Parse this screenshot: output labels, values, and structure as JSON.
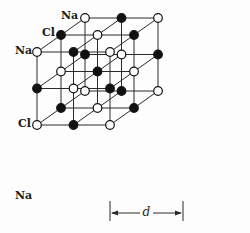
{
  "diagram": {
    "grid_size": 3,
    "origin": {
      "x": 37,
      "y": 52
    },
    "spacing": 73,
    "depth_offset": {
      "dx": 24,
      "dy": -17
    },
    "colors": {
      "line": "#2a2a2a",
      "na_fill": "#ffffff",
      "cl_fill": "#111111",
      "stroke": "#111111"
    },
    "ion_labels": [
      {
        "text": "Na",
        "x": 61,
        "y": 10
      },
      {
        "text": "Cl",
        "x": 42,
        "y": 27
      },
      {
        "text": "Na",
        "x": 15,
        "y": 45
      },
      {
        "text": "Cl",
        "x": 18,
        "y": 118
      },
      {
        "text": "Na",
        "x": 15,
        "y": 190
      }
    ],
    "dimension": {
      "label": "d",
      "x1": 110,
      "x2": 183,
      "y": 213
    }
  }
}
